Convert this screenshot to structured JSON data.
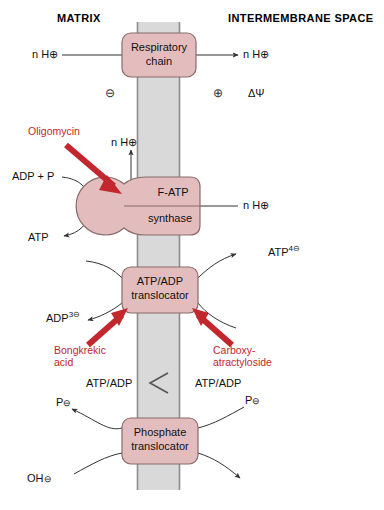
{
  "colors": {
    "protein_fill": "#e3bdbd",
    "protein_stroke": "#8a6b6b",
    "membrane_fill": "#d9d9d9",
    "membrane_edge": "#8c8c8c",
    "inhibitor_red": "#c1272d",
    "line": "#333333",
    "text": "#111111"
  },
  "headers": {
    "left": "MATRIX",
    "right": "INTERMEMBRANE SPACE"
  },
  "membrane": {
    "x_left": 137,
    "x_right": 180,
    "y_top": 22,
    "y_bottom": 490
  },
  "complexes": [
    {
      "id": "respiratory-chain",
      "line1": "Respiratory",
      "line2": "chain",
      "shape": "rounded-rect",
      "x": 122,
      "y": 33,
      "w": 74,
      "h": 44
    },
    {
      "id": "f-atp-synthase",
      "line1": "F-ATP",
      "line2": "synthase",
      "shape": "lollipop",
      "x": 110,
      "y": 177,
      "w": 90,
      "h": 58
    },
    {
      "id": "atp-adp-translocator",
      "line1": "ATP/ADP",
      "line2": "translocator",
      "shape": "rounded-rect",
      "x": 122,
      "y": 267,
      "w": 76,
      "h": 46
    },
    {
      "id": "phosphate-translocator",
      "line1": "Phosphate",
      "line2": "translocator",
      "shape": "rounded-rect",
      "x": 122,
      "y": 418,
      "w": 76,
      "h": 46
    }
  ],
  "labels": {
    "h_in_resp": "n H",
    "h_in_resp_charge": "⊕",
    "h_out_resp": "n H",
    "h_out_resp_charge": "⊕",
    "minus_charge": "⊖",
    "plus_charge": "⊕",
    "delta_psi": "ΔΨ",
    "h_up_synthase": "n H",
    "h_up_synthase_charge": "⊕",
    "h_right_synthase": "n H",
    "h_right_synthase_charge": "⊕",
    "adp_plus_p": "ADP + P",
    "atp_out": "ATP",
    "atp4": "ATP",
    "atp4_sup": "4⊖",
    "adp3": "ADP",
    "adp3_sup": "3⊖",
    "ratio_left": "ATP/ADP",
    "ratio_right": "ATP/ADP",
    "ratio_operator": "<",
    "p_left": "P",
    "p_left_charge": "⊖",
    "p_right": "P",
    "p_right_charge": "⊖",
    "oh_left": "OH",
    "oh_left_charge": "⊖"
  },
  "inhibitors": [
    {
      "id": "oligomycin",
      "line1": "Oligomycin",
      "line2": ""
    },
    {
      "id": "bongkrekic-acid",
      "line1": "Bongkrekic",
      "line2": "acid"
    },
    {
      "id": "carboxy-atractyloside",
      "line1": "Carboxy-",
      "line2": "atractyloside"
    }
  ]
}
